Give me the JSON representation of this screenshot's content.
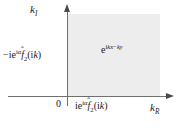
{
  "figure": {
    "kind": "complex-k-plane-diagram",
    "background_color": "#ffffff",
    "shaded_region": {
      "name": "first-quadrant",
      "fill_color": "#ededed",
      "x_range": [
        0,
        92
      ],
      "y_range": [
        0,
        83
      ]
    },
    "axes": {
      "color": "#6f6f6f",
      "arrow_color": "#4a4a4a",
      "vertical": {
        "label_text": "k",
        "label_subscript": "I",
        "direction": "up"
      },
      "horizontal": {
        "label_text": "k",
        "label_subscript": "R",
        "direction": "right"
      },
      "origin_label": "0"
    },
    "annotations": {
      "left_term": {
        "sign": "−",
        "i": "i",
        "e": "e",
        "exponent_i": "i",
        "exponent_alpha": "α",
        "f": "f",
        "hat": "ˆ",
        "f_subscript": "2",
        "open_paren": "(",
        "arg_i": "i",
        "arg_k": "k",
        "close_paren": ")"
      },
      "bottom_term": {
        "i": "i",
        "e": "e",
        "exponent_i": "i",
        "exponent_alpha": "α",
        "f": "f",
        "hat": "ˆ",
        "f_subscript": "2",
        "open_paren": "(",
        "arg_i": "i",
        "arg_k": "k",
        "close_paren": ")"
      },
      "interior_term": {
        "e": "e",
        "exp_i": "i",
        "exp_k1": "k",
        "exp_x": "x",
        "exp_minus": "−",
        "exp_k2": "k",
        "exp_y": "y"
      }
    }
  }
}
